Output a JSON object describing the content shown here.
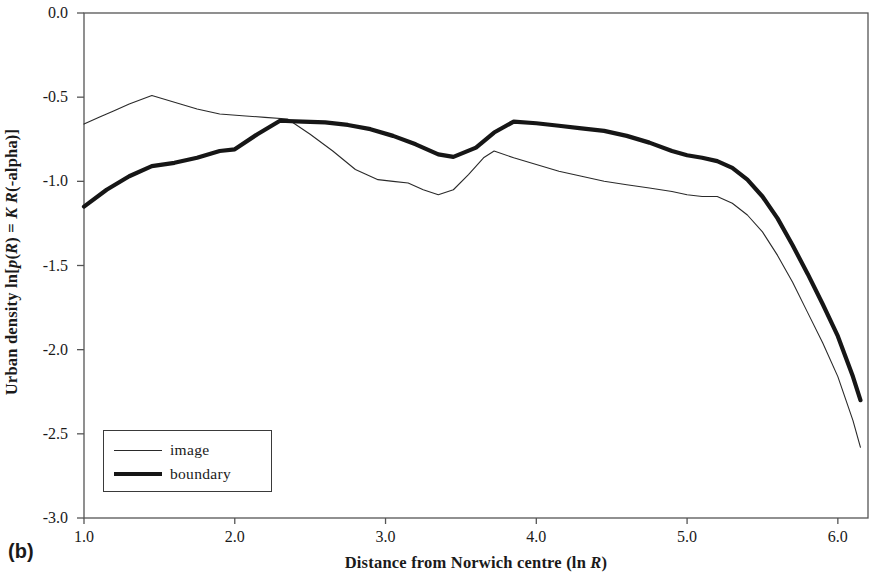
{
  "panel": {
    "tag": "(b)"
  },
  "chart_data": {
    "type": "line",
    "title": "",
    "xlabel": "Distance from Norwich centre (ln R)",
    "xlabel_plain": "Distance from Norwich centre (ln ",
    "xlabel_italic": "R",
    "xlabel_tail": ")",
    "ylabel": "Urban density ln[p(R) = K R(-alpha)]",
    "ylabel_parts": {
      "a": "Urban density ln[",
      "b": "p",
      "c": "(",
      "d": "R",
      "e": ") = ",
      "f": "K",
      "g": " ",
      "h": "R",
      "i": "(-alpha)]"
    },
    "xlim": [
      1.0,
      6.2
    ],
    "ylim": [
      -3.0,
      0.0
    ],
    "grid": false,
    "legend_position": "lower-left",
    "xticks": [
      "1.0",
      "2.0",
      "3.0",
      "4.0",
      "5.0",
      "6.0"
    ],
    "xtick_values": [
      1.0,
      2.0,
      3.0,
      4.0,
      5.0,
      6.0
    ],
    "yticks": [
      "0.0",
      "-0.5",
      "-1.0",
      "-1.5",
      "-2.0",
      "-2.5",
      "-3.0"
    ],
    "ytick_values": [
      0.0,
      -0.5,
      -1.0,
      -1.5,
      -2.0,
      -2.5,
      -3.0
    ],
    "series": [
      {
        "name": "image",
        "style": "thin",
        "color": "#2a2a2a",
        "width": 1.1,
        "x": [
          1.0,
          1.1,
          1.2,
          1.3,
          1.45,
          1.6,
          1.75,
          1.9,
          2.05,
          2.2,
          2.35,
          2.5,
          2.65,
          2.8,
          2.95,
          3.05,
          3.15,
          3.25,
          3.35,
          3.45,
          3.55,
          3.65,
          3.72,
          3.85,
          4.0,
          4.15,
          4.3,
          4.45,
          4.6,
          4.75,
          4.9,
          5.0,
          5.1,
          5.2,
          5.3,
          5.4,
          5.5,
          5.6,
          5.7,
          5.8,
          5.9,
          6.0,
          6.1,
          6.15
        ],
        "y": [
          -0.66,
          -0.62,
          -0.58,
          -0.54,
          -0.49,
          -0.53,
          -0.57,
          -0.6,
          -0.61,
          -0.62,
          -0.63,
          -0.72,
          -0.82,
          -0.93,
          -0.99,
          -1.0,
          -1.01,
          -1.05,
          -1.08,
          -1.05,
          -0.96,
          -0.86,
          -0.82,
          -0.86,
          -0.9,
          -0.94,
          -0.97,
          -1.0,
          -1.02,
          -1.04,
          -1.06,
          -1.08,
          -1.09,
          -1.09,
          -1.13,
          -1.2,
          -1.3,
          -1.44,
          -1.6,
          -1.78,
          -1.96,
          -2.16,
          -2.42,
          -2.58
        ]
      },
      {
        "name": "boundary",
        "style": "thick",
        "color": "#161616",
        "width": 4.2,
        "x": [
          1.0,
          1.15,
          1.3,
          1.45,
          1.6,
          1.75,
          1.9,
          2.0,
          2.15,
          2.3,
          2.45,
          2.6,
          2.75,
          2.9,
          3.05,
          3.2,
          3.35,
          3.45,
          3.6,
          3.72,
          3.85,
          4.0,
          4.15,
          4.3,
          4.45,
          4.6,
          4.75,
          4.9,
          5.0,
          5.1,
          5.2,
          5.3,
          5.4,
          5.5,
          5.6,
          5.7,
          5.8,
          5.9,
          6.0,
          6.1,
          6.15
        ],
        "y": [
          -1.15,
          -1.05,
          -0.97,
          -0.91,
          -0.89,
          -0.86,
          -0.82,
          -0.81,
          -0.72,
          -0.64,
          -0.645,
          -0.65,
          -0.665,
          -0.69,
          -0.73,
          -0.78,
          -0.84,
          -0.855,
          -0.8,
          -0.71,
          -0.645,
          -0.655,
          -0.67,
          -0.685,
          -0.7,
          -0.73,
          -0.77,
          -0.82,
          -0.845,
          -0.86,
          -0.88,
          -0.92,
          -0.99,
          -1.09,
          -1.22,
          -1.38,
          -1.55,
          -1.73,
          -1.92,
          -2.16,
          -2.3
        ]
      }
    ],
    "legend": [
      {
        "label": "image",
        "style": "thin"
      },
      {
        "label": "boundary",
        "style": "thick"
      }
    ],
    "axes_frame": {
      "color": "#555555",
      "left": true,
      "bottom": true,
      "top": true,
      "right": true
    }
  }
}
